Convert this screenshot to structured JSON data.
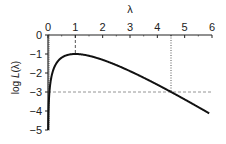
{
  "chart_data": {
    "type": "line",
    "title": "",
    "xlabel": "λ",
    "ylabel": "log L(λ)",
    "xlim": [
      0,
      6
    ],
    "ylim": [
      -5,
      0
    ],
    "x_ticks": [
      "0",
      "1",
      "2",
      "3",
      "4",
      "5",
      "6"
    ],
    "y_ticks": [
      "0",
      "-1",
      "-2",
      "-3",
      "-4",
      "-5"
    ],
    "x_axis_position": "top",
    "grid": false,
    "legend": null,
    "series": [
      {
        "name": "log L(λ)",
        "x": [
          0.02,
          0.05,
          0.1,
          0.2,
          0.3,
          0.5,
          0.75,
          1.0,
          1.5,
          2.0,
          2.5,
          3.0,
          3.5,
          4.0,
          4.5,
          5.0,
          5.5,
          5.9
        ],
        "values": [
          -4.9,
          -3.96,
          -3.3,
          -2.61,
          -2.2,
          -1.69,
          -1.29,
          -1.0,
          -1.09,
          -1.31,
          -1.58,
          -1.9,
          -2.25,
          -2.61,
          -3.0,
          -3.39,
          -3.8,
          -4.13
        ]
      }
    ],
    "annotations": [
      {
        "type": "vline",
        "x": 1.0,
        "from_y": 0,
        "to_y": -1.0,
        "style": "dashed",
        "note": "maximum at λ=1"
      },
      {
        "type": "vline",
        "x": 4.5,
        "from_y": 0,
        "to_y": -3.0,
        "style": "dotted"
      },
      {
        "type": "hline",
        "y": -3.0,
        "from_x": 0,
        "to_x": 6,
        "style": "dashed",
        "color": "#888888"
      }
    ]
  },
  "axis_labels": {
    "x": "λ",
    "y_prefix": "log ",
    "y_italic": "L",
    "y_suffix": "(λ)"
  },
  "colors": {
    "curve": "#111111",
    "axis": "#222222",
    "guide": "#888888"
  }
}
